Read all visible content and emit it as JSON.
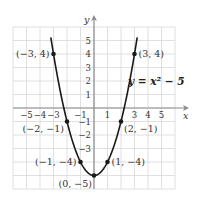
{
  "chart_data": {
    "type": "line",
    "title": "",
    "equation": "y = x² − 5",
    "xlabel": "x",
    "ylabel": "y",
    "xlim": [
      -6,
      6
    ],
    "ylim": [
      -6,
      6
    ],
    "grid": true,
    "x_ticks": [
      -5,
      -4,
      -3,
      -1,
      1,
      3,
      4,
      5
    ],
    "x_tick_labels": [
      "−5",
      "−4",
      "−3",
      "−1",
      "1",
      "3",
      "4",
      "5"
    ],
    "y_ticks": [
      5,
      4,
      3,
      2,
      1,
      -1,
      -2,
      -3
    ],
    "y_tick_labels": [
      "5",
      "4",
      "3",
      "2",
      "1",
      "−1",
      "−2",
      "−3"
    ],
    "curve": {
      "function": "x^2 - 5",
      "x_range": [
        -3.2,
        3.2
      ]
    },
    "points": [
      {
        "x": -3,
        "y": 4,
        "label": "(−3, 4)",
        "pos": "left"
      },
      {
        "x": 3,
        "y": 4,
        "label": "(3, 4)",
        "pos": "right"
      },
      {
        "x": -2,
        "y": -1,
        "label": "(−2, −1)",
        "pos": "below-left"
      },
      {
        "x": 2,
        "y": -1,
        "label": "(2, −1)",
        "pos": "below-right"
      },
      {
        "x": -1,
        "y": -4,
        "label": "(−1, −4)",
        "pos": "left"
      },
      {
        "x": 1,
        "y": -4,
        "label": "(1, −4)",
        "pos": "right"
      },
      {
        "x": 0,
        "y": -5,
        "label": "(0, −5)",
        "pos": "below"
      }
    ],
    "colors": {
      "grid": "#d8d8d8",
      "axis": "#8a8a8a",
      "curve": "#1a1a1a"
    }
  }
}
